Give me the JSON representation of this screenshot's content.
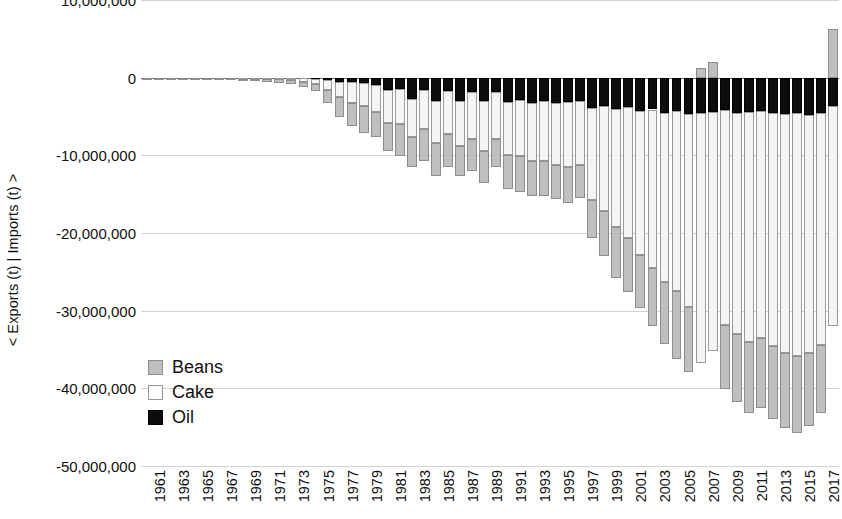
{
  "chart_data": {
    "type": "bar",
    "stacked": true,
    "orientation": "vertical",
    "title": "",
    "xlabel": "",
    "ylabel": "< Exports (t) | Imports (t) >",
    "ylim": [
      -50000000,
      10000000
    ],
    "ytick_labels": [
      "10,000,000",
      "0",
      "-10,000,000",
      "-20,000,000",
      "-30,000,000",
      "-40,000,000",
      "-50,000,000"
    ],
    "ytick_values": [
      10000000,
      0,
      -10000000,
      -20000000,
      -30000000,
      -40000000,
      -50000000
    ],
    "grid": true,
    "legend_position": "inside-lower-left",
    "colors": {
      "Beans": "#bfbfbf",
      "Cake": "#f4f4f4",
      "Oil": "#0d0d0d"
    },
    "x": [
      1961,
      1962,
      1963,
      1964,
      1965,
      1966,
      1967,
      1968,
      1969,
      1970,
      1971,
      1972,
      1973,
      1974,
      1975,
      1976,
      1977,
      1978,
      1979,
      1980,
      1981,
      1982,
      1983,
      1984,
      1985,
      1986,
      1987,
      1988,
      1989,
      1990,
      1991,
      1992,
      1993,
      1994,
      1995,
      1996,
      1997,
      1998,
      1999,
      2000,
      2001,
      2002,
      2003,
      2004,
      2005,
      2006,
      2007,
      2008,
      2009,
      2010,
      2011,
      2012,
      2013,
      2014,
      2015,
      2016,
      2017,
      2018
    ],
    "xtick_labels": [
      "1961",
      "1963",
      "1965",
      "1967",
      "1969",
      "1971",
      "1973",
      "1975",
      "1977",
      "1979",
      "1981",
      "1983",
      "1985",
      "1987",
      "1989",
      "1991",
      "1993",
      "1995",
      "1997",
      "1999",
      "2001",
      "2003",
      "2005",
      "2007",
      "2009",
      "2011",
      "2013",
      "2015",
      "2017"
    ],
    "series": [
      {
        "name": "Beans",
        "values": [
          -80000,
          -90000,
          -110000,
          -130000,
          -150000,
          -180000,
          -200000,
          -230000,
          -260000,
          -300000,
          -340000,
          -420000,
          -520000,
          -700000,
          -900000,
          -1600000,
          -2600000,
          -3000000,
          -3400000,
          -3300000,
          -3700000,
          -4100000,
          -3900000,
          -4100000,
          -4300000,
          -4200000,
          -3900000,
          -4100000,
          -4200000,
          -3600000,
          -4300000,
          -4600000,
          -4500000,
          -4600000,
          -4300000,
          -4700000,
          -4300000,
          -5000000,
          -5800000,
          -6600000,
          -7000000,
          -6900000,
          -7500000,
          -8000000,
          -8700000,
          -8400000,
          1200000,
          2000000,
          -8300000,
          -8800000,
          -9200000,
          -9000000,
          -9300000,
          -9600000,
          -9800000,
          -9500000,
          -8800000,
          6300000
        ]
      },
      {
        "name": "Cake",
        "values": [
          -20000,
          -25000,
          -30000,
          -40000,
          -50000,
          -60000,
          -70000,
          -80000,
          -90000,
          -110000,
          -140000,
          -180000,
          -240000,
          -400000,
          -600000,
          -1300000,
          -2000000,
          -2600000,
          -3000000,
          -3500000,
          -4200000,
          -4500000,
          -4800000,
          -5000000,
          -5400000,
          -5600000,
          -5800000,
          -6100000,
          -6400000,
          -6000000,
          -6900000,
          -7200000,
          -7500000,
          -7700000,
          -8000000,
          -8400000,
          -8200000,
          -11800000,
          -13600000,
          -15200000,
          -16800000,
          -18500000,
          -20400000,
          -21800000,
          -23200000,
          -24800000,
          -32200000,
          -30800000,
          -27600000,
          -28400000,
          -29600000,
          -29200000,
          -30100000,
          -30800000,
          -31400000,
          -30600000,
          -29800000,
          -28400000
        ]
      },
      {
        "name": "Oil",
        "values": [
          -5000,
          -6000,
          -8000,
          -10000,
          -12000,
          -15000,
          -18000,
          -20000,
          -24000,
          -28000,
          -34000,
          -44000,
          -60000,
          -100000,
          -160000,
          -300000,
          -500000,
          -600000,
          -700000,
          -900000,
          -1600000,
          -1500000,
          -2800000,
          -1600000,
          -3000000,
          -1700000,
          -3000000,
          -1800000,
          -3000000,
          -1900000,
          -3100000,
          -2900000,
          -3200000,
          -3000000,
          -3300000,
          -3100000,
          -3000000,
          -3900000,
          -3600000,
          -4000000,
          -3800000,
          -4300000,
          -4100000,
          -4500000,
          -4300000,
          -4700000,
          -4600000,
          -4400000,
          -4200000,
          -4600000,
          -4400000,
          -4300000,
          -4500000,
          -4700000,
          -4500000,
          -4800000,
          -4600000,
          -3600000
        ]
      }
    ]
  },
  "legend": {
    "items": [
      {
        "label": "Beans",
        "swatch": "beans"
      },
      {
        "label": "Cake",
        "swatch": "cake"
      },
      {
        "label": "Oil",
        "swatch": "oil"
      }
    ]
  }
}
